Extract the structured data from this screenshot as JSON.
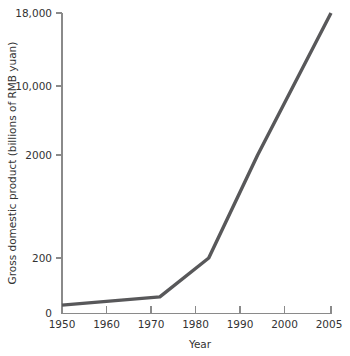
{
  "chart_data": {
    "type": "line",
    "title": "",
    "xlabel": "Year",
    "ylabel": "Gross domestic product (billions of RMB yuan)",
    "x": [
      1950,
      1970,
      1980,
      1990,
      2005
    ],
    "values": [
      30,
      60,
      200,
      2000,
      18000
    ],
    "series": [
      {
        "name": "Gross domestic product",
        "values": [
          30,
          60,
          200,
          2000,
          18000
        ]
      }
    ],
    "ytick_labels": [
      "0",
      "200",
      "2000",
      "10,000",
      "18,000"
    ],
    "ytick_values": [
      0,
      200,
      2000,
      10000,
      18000
    ],
    "xtick_labels": [
      "1950",
      "1960",
      "1970",
      "1980",
      "1990",
      "2000",
      "2005"
    ],
    "xtick_values": [
      1950,
      1960,
      1970,
      1980,
      1990,
      2000,
      2005
    ],
    "xlim": [
      1950,
      2005
    ],
    "ylim": [
      0,
      18000
    ],
    "yscale": "compressed",
    "grid": false,
    "legend": false,
    "legend_position": "none",
    "line_color": "#58585a",
    "axis_color": "#8a8a8a",
    "text_color": "#333333",
    "background_color": "#ffffff"
  },
  "ylabels": {
    "t0": "0",
    "t1": "200",
    "t2": "2000",
    "t3": "10,000",
    "t4": "18,000"
  },
  "xlabels": {
    "t0": "1950",
    "t1": "1960",
    "t2": "1970",
    "t3": "1980",
    "t4": "1990",
    "t5": "2000",
    "t6": "2005"
  },
  "axis_titles": {
    "x": "Year",
    "y": "Gross domestic product (billions of RMB yuan)"
  }
}
